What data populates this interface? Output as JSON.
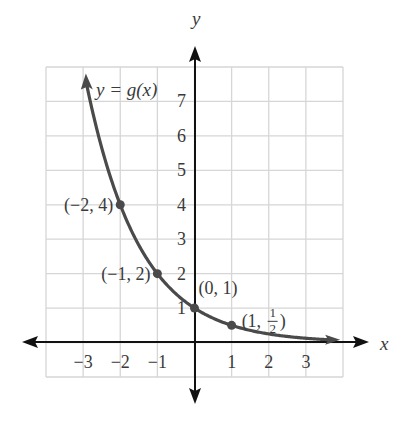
{
  "chart_data": {
    "type": "line",
    "title": "",
    "function_label": "y = g(x)",
    "xlabel": "x",
    "ylabel": "y",
    "xlim": [
      -4,
      4
    ],
    "ylim": [
      -1,
      8
    ],
    "grid": true,
    "x_ticks": [
      -3,
      -2,
      -1,
      1,
      2,
      3
    ],
    "x_tick_labels": [
      "−3",
      "−2",
      "−1",
      "1",
      "2",
      "3"
    ],
    "y_ticks": [
      1,
      2,
      3,
      4,
      5,
      6,
      7
    ],
    "y_tick_labels": [
      "1",
      "2",
      "3",
      "4",
      "5",
      "6",
      "7"
    ],
    "series": [
      {
        "name": "g(x) = (1/2)^x",
        "formula": "(1/2)^x",
        "x_range": [
          -2.9,
          3.6
        ],
        "color": "#4a4a4a"
      }
    ],
    "points": [
      {
        "x": -2,
        "y": 4,
        "label": "(−2, 4)"
      },
      {
        "x": -1,
        "y": 2,
        "label": "(−1, 2)"
      },
      {
        "x": 0,
        "y": 1,
        "label": "(0, 1)"
      },
      {
        "x": 1,
        "y": 0.5,
        "label": "(1, 1/2)"
      }
    ]
  },
  "colors": {
    "curve": "#4a4a4a",
    "axis": "#111111",
    "grid": "#d6d6d6",
    "text": "#3a3a3a"
  }
}
